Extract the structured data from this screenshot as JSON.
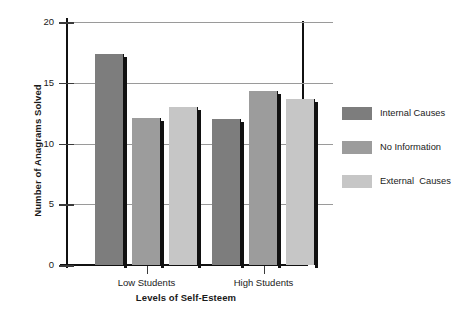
{
  "chart_data": {
    "type": "bar",
    "title": "",
    "xlabel": "Levels of Self-Esteem",
    "ylabel": "Number of Anagrams Solved",
    "categories": [
      "Low Students",
      "High Students"
    ],
    "series": [
      {
        "name": "Internal Causes",
        "color": "#7d7d7d",
        "values": [
          17.4,
          12.0
        ]
      },
      {
        "name": "No Information",
        "color": "#9c9c9c",
        "values": [
          12.1,
          14.3
        ]
      },
      {
        "name": "External  Causes",
        "color": "#c6c6c6",
        "values": [
          13.0,
          13.7
        ]
      }
    ],
    "ylim": [
      0,
      20
    ],
    "yticks": [
      0,
      5,
      10,
      15,
      20
    ],
    "ytick_labels": [
      "0",
      "5",
      "10",
      "15",
      "20"
    ],
    "grid": true,
    "legend_position": "right"
  },
  "legend": {
    "items": [
      {
        "label": "Internal Causes",
        "color": "#7d7d7d"
      },
      {
        "label": "No Information",
        "color": "#9c9c9c"
      },
      {
        "label": "External  Causes",
        "color": "#c6c6c6"
      }
    ]
  }
}
